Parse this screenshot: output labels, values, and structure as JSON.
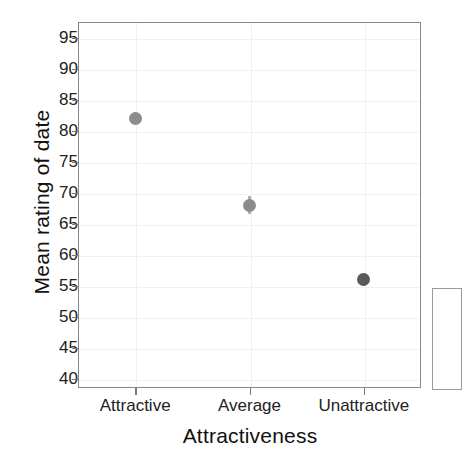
{
  "chart_data": {
    "type": "scatter",
    "title": "",
    "xlabel": "Attractiveness",
    "ylabel": "Mean rating of date",
    "categories": [
      "Attractive",
      "Average",
      "Unattractive"
    ],
    "values": [
      82,
      68,
      56
    ],
    "error_low": [
      81,
      66.5,
      55
    ],
    "error_high": [
      83,
      69.5,
      57
    ],
    "yticks": [
      40,
      45,
      50,
      55,
      60,
      65,
      70,
      75,
      80,
      85,
      90,
      95
    ],
    "ytick_labels": [
      "40",
      "45",
      "50",
      "55",
      "60",
      "65",
      "70",
      "75",
      "80",
      "85",
      "90",
      "95"
    ],
    "ylim": [
      38.5,
      97.5
    ],
    "grid": true,
    "legend": "none",
    "point_colors": [
      "#8c8c8c",
      "#8c8c8c",
      "#5a5a5a"
    ],
    "errorbar_color": "#b0b0b0",
    "panel_border_color": "#888888",
    "grid_color": "#f0f0f0",
    "background_color": "#ffffff"
  },
  "axes": {
    "y_title": "Mean rating of date",
    "x_title": "Attractiveness"
  },
  "ticks": {
    "y": [
      {
        "label": "95",
        "value": 95
      },
      {
        "label": "90",
        "value": 90
      },
      {
        "label": "85",
        "value": 85
      },
      {
        "label": "80",
        "value": 80
      },
      {
        "label": "75",
        "value": 75
      },
      {
        "label": "70",
        "value": 70
      },
      {
        "label": "65",
        "value": 65
      },
      {
        "label": "60",
        "value": 60
      },
      {
        "label": "55",
        "value": 55
      },
      {
        "label": "50",
        "value": 50
      },
      {
        "label": "45",
        "value": 45
      },
      {
        "label": "40",
        "value": 40
      }
    ],
    "x": [
      {
        "label": "Attractive",
        "index": 0
      },
      {
        "label": "Average",
        "index": 1
      },
      {
        "label": "Unattractive",
        "index": 2
      }
    ]
  }
}
